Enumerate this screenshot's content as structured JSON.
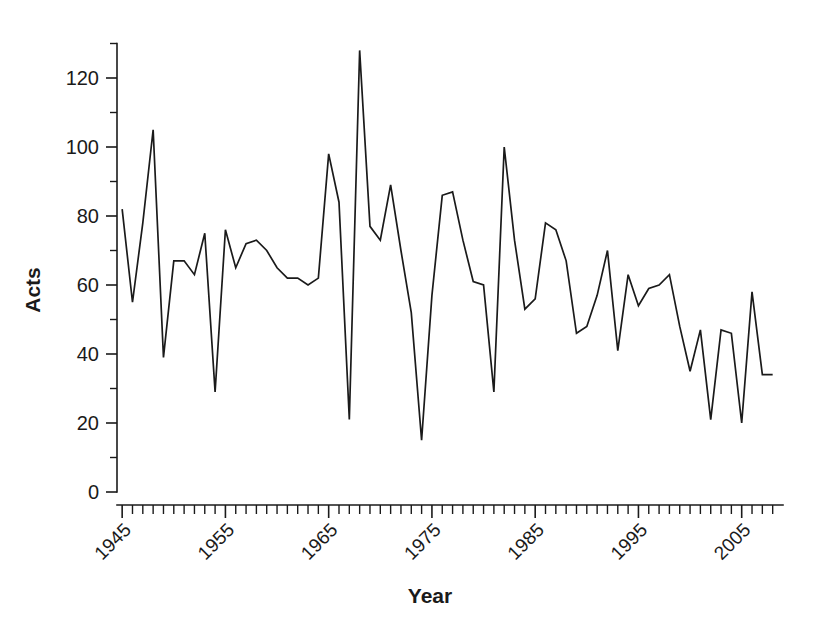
{
  "chart_data": {
    "type": "line",
    "title": "",
    "xlabel": "Year",
    "ylabel": "Acts",
    "xlim": [
      1944.5,
      2009
    ],
    "ylim": [
      0,
      130
    ],
    "grid": false,
    "legend": null,
    "y_tick_labels": [
      "0",
      "20",
      "40",
      "60",
      "80",
      "100",
      "120"
    ],
    "y_ticks_major": [
      0,
      20,
      40,
      60,
      80,
      100,
      120
    ],
    "y_ticks_minor": [
      10,
      30,
      50,
      70,
      90,
      110,
      130
    ],
    "x_tick_labels": [
      "1945",
      "1955",
      "1965",
      "1975",
      "1985",
      "1995",
      "2005"
    ],
    "x_ticks_major": [
      1945,
      1955,
      1965,
      1975,
      1985,
      1995,
      2005
    ],
    "x_tick_step_minor": 1,
    "series_name": "Acts",
    "line_color": "#1a1a1a",
    "x": [
      1945,
      1946,
      1947,
      1948,
      1949,
      1950,
      1951,
      1952,
      1953,
      1954,
      1955,
      1956,
      1957,
      1958,
      1959,
      1960,
      1961,
      1962,
      1963,
      1964,
      1965,
      1966,
      1967,
      1968,
      1969,
      1970,
      1971,
      1972,
      1973,
      1974,
      1975,
      1976,
      1977,
      1978,
      1979,
      1980,
      1981,
      1982,
      1983,
      1984,
      1985,
      1986,
      1987,
      1988,
      1989,
      1990,
      1991,
      1992,
      1993,
      1994,
      1995,
      1996,
      1997,
      1998,
      1999,
      2000,
      2001,
      2002,
      2003,
      2004,
      2005,
      2006,
      2007,
      2008
    ],
    "values": [
      82,
      55,
      78,
      105,
      39,
      67,
      67,
      63,
      75,
      29,
      76,
      65,
      72,
      73,
      70,
      65,
      62,
      62,
      60,
      62,
      98,
      84,
      21,
      128,
      77,
      73,
      89,
      70,
      52,
      15,
      57,
      86,
      87,
      73,
      61,
      60,
      29,
      100,
      73,
      53,
      56,
      78,
      76,
      67,
      46,
      48,
      57,
      70,
      41,
      63,
      54,
      59,
      60,
      63,
      48,
      35,
      47,
      21,
      47,
      46,
      20,
      58,
      34,
      34
    ]
  }
}
